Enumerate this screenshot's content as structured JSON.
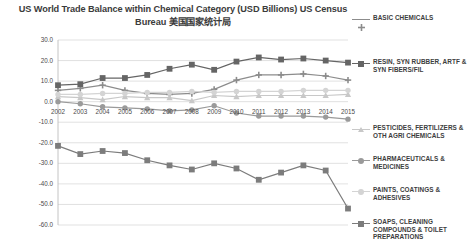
{
  "chart_data": {
    "type": "line",
    "title": "US World Trade Balance within Chemical Category (USD Billions) US Census Bureau 美国国家统计局",
    "xlabel": "",
    "ylabel": "",
    "ylim": [
      -60.0,
      30.0
    ],
    "ytick_step": 10.0,
    "grid": true,
    "legend_position": "right",
    "x": [
      2002,
      2003,
      2004,
      2005,
      2006,
      2007,
      2008,
      2009,
      2010,
      2011,
      2012,
      2013,
      2014,
      2015
    ],
    "categories": [
      "2002",
      "2003",
      "2004",
      "2005",
      "2006",
      "2007",
      "2008",
      "2009",
      "2010",
      "2011",
      "2012",
      "2013",
      "2014",
      "2015"
    ],
    "yticks": [
      "30.0",
      "20.0",
      "10.0",
      "0.0",
      "-10.0",
      "-20.0",
      "-30.0",
      "-40.0",
      "-50.0",
      "-60.0"
    ],
    "series": [
      {
        "name": "BASIC CHEMICALS",
        "color": "#8c8c8c",
        "marker": "plus",
        "values": [
          5.5,
          6.5,
          8.0,
          5.5,
          4.0,
          3.5,
          4.0,
          6.0,
          10.5,
          13.0,
          13.0,
          13.5,
          12.5,
          10.5
        ]
      },
      {
        "name": "RESIN, SYN RUBBER, ARTF & SYN FIBERS/FIL",
        "color": "#656565",
        "marker": "square",
        "values": [
          8.0,
          8.5,
          11.5,
          11.5,
          13.0,
          16.0,
          18.0,
          15.5,
          19.5,
          21.5,
          20.5,
          21.0,
          20.0,
          19.0
        ]
      },
      {
        "name": "PESTICIDES, FERTILIZERS & OTH AGRI CHEMICALS",
        "color": "#c8c8c8",
        "marker": "triangle",
        "values": [
          2.5,
          2.0,
          1.0,
          2.5,
          2.0,
          2.0,
          0.5,
          3.0,
          2.5,
          3.0,
          3.0,
          3.0,
          3.0,
          3.5
        ]
      },
      {
        "name": "PHARMACEUTICALS & MEDICINES",
        "color": "#9a9a9a",
        "marker": "circle",
        "values": [
          0.0,
          -1.0,
          -2.5,
          -3.0,
          -3.5,
          -4.5,
          -4.0,
          -2.0,
          -5.5,
          -7.0,
          -7.0,
          -7.0,
          -7.5,
          -8.5
        ]
      },
      {
        "name": "PAINTS, COATINGS & ADHESIVES",
        "color": "#d4d4d4",
        "marker": "circle",
        "values": [
          3.5,
          3.5,
          4.0,
          4.0,
          4.5,
          4.5,
          5.0,
          4.5,
          5.0,
          5.0,
          5.0,
          5.5,
          5.5,
          5.5
        ]
      },
      {
        "name": "SOAPS, CLEANING COMPOUNDS & TOILET PREPARATIONS",
        "color": "#7c7c7c",
        "marker": "square",
        "values": [
          -21.5,
          -25.5,
          -24.0,
          -25.0,
          -28.5,
          -31.0,
          -33.0,
          -30.0,
          -32.5,
          -38.0,
          -34.5,
          -31.0,
          -33.5,
          -52.0
        ]
      }
    ]
  }
}
